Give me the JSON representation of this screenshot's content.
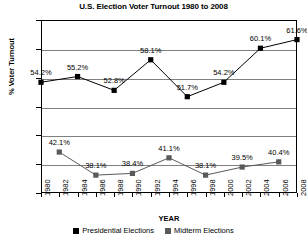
{
  "chart_data": {
    "type": "line",
    "title": "U.S. Election Voter Turnout 1980 to 2008",
    "xlabel": "YEAR",
    "ylabel": "% Voter Turnout",
    "ylim": [
      35,
      65
    ],
    "ytick_labels": [
      "65%",
      "60%",
      "55%",
      "50%",
      "45%",
      "40%",
      "35%"
    ],
    "ytick_values": [
      65,
      60,
      55,
      50,
      45,
      40,
      35
    ],
    "xlim": [
      1980,
      2008
    ],
    "xtick_labels": [
      "1980",
      "1982",
      "1984",
      "1986",
      "1988",
      "1990",
      "1992",
      "1994",
      "1996",
      "1998",
      "2000",
      "2002",
      "2004",
      "2006",
      "2008"
    ],
    "grid": "horizontal",
    "legend_position": "bottom",
    "series": [
      {
        "name": "Presidential Elections",
        "color": "#000000",
        "marker": "square",
        "x": [
          1980,
          1984,
          1988,
          1992,
          1996,
          2000,
          2004,
          2008
        ],
        "values": [
          54.2,
          55.2,
          52.8,
          58.1,
          51.7,
          54.2,
          60.1,
          61.6
        ],
        "labels": [
          "54.2%",
          "55.2%",
          "52.8%",
          "58.1%",
          "51.7%",
          "54.2%",
          "60.1%",
          "61.6%"
        ]
      },
      {
        "name": "Midterm Elections",
        "color": "#595959",
        "marker": "square",
        "x": [
          1982,
          1986,
          1990,
          1994,
          1998,
          2002,
          2006
        ],
        "values": [
          42.1,
          38.1,
          38.4,
          41.1,
          38.1,
          39.5,
          40.4
        ],
        "labels": [
          "42.1%",
          "38.1%",
          "38.4%",
          "41.1%",
          "38.1%",
          "39.5%",
          "40.4%"
        ]
      }
    ]
  }
}
